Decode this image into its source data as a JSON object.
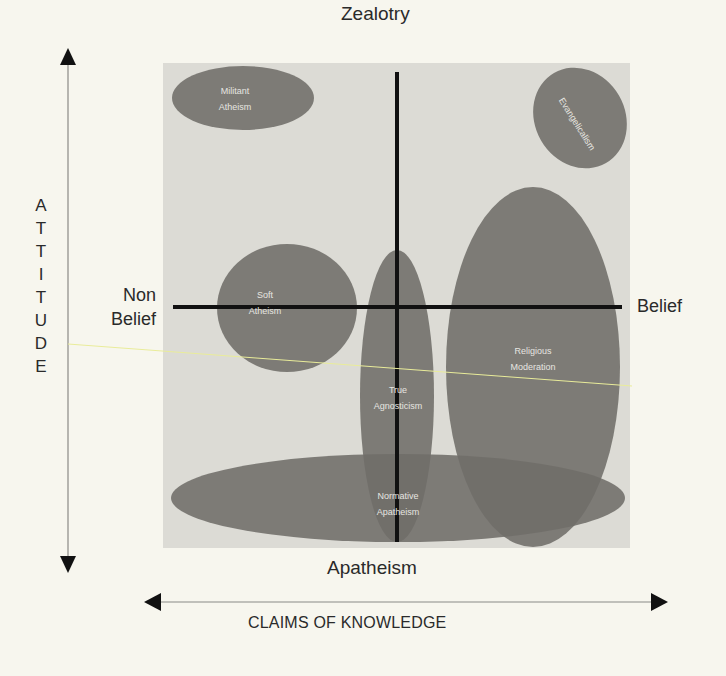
{
  "diagram": {
    "axes": {
      "top_label": "Zealotry",
      "bottom_label": "Apatheism",
      "left_label_line1": "Non",
      "left_label_line2": "Belief",
      "right_label": "Belief",
      "x_axis_title": "CLAIMS OF KNOWLEDGE",
      "y_axis_title": "ATTITUDE",
      "y_axis_letters": [
        "A",
        "T",
        "T",
        "I",
        "T",
        "U",
        "D",
        "E"
      ]
    },
    "regions": [
      {
        "id": "militant-atheism",
        "line1": "Militant",
        "line2": "Atheism"
      },
      {
        "id": "evangelicalism",
        "line1": "Evangelicalism",
        "line2": ""
      },
      {
        "id": "soft-atheism",
        "line1": "Soft",
        "line2": "Atheism"
      },
      {
        "id": "true-agnosticism",
        "line1": "True",
        "line2": "Agnosticism"
      },
      {
        "id": "religious-moderation",
        "line1": "Religious",
        "line2": "Moderation"
      },
      {
        "id": "normative-apatheism",
        "line1": "Normative",
        "line2": "Apatheism"
      }
    ],
    "colors": {
      "page_background": "#f7f6ee",
      "panel_background": "#dcdbd5",
      "region_fill": "#6f6d69",
      "axis_line": "#111111",
      "label_text": "#2a2a2a",
      "region_text": "#e7e6e1"
    }
  }
}
